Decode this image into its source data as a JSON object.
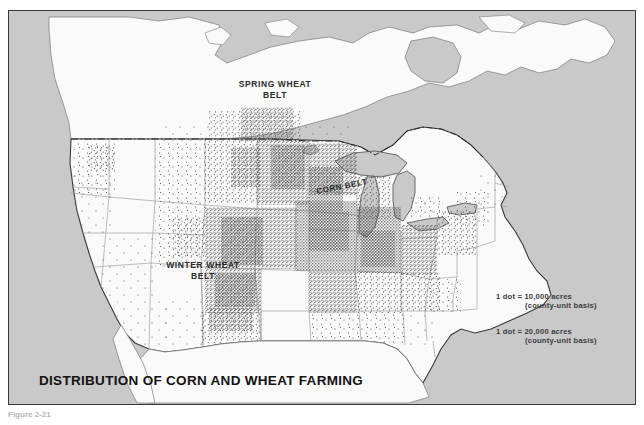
{
  "figure": {
    "caption": "Figure 2-21"
  },
  "map": {
    "title": "DISTRIBUTION OF CORN AND WHEAT FARMING",
    "labels": {
      "spring_wheat": "SPRING WHEAT\nBELT",
      "corn_belt": "CORN BELT",
      "winter_wheat": "WINTER WHEAT\nBELT"
    },
    "legend": [
      {
        "value": "1 dot  =  10,000 acres",
        "basis": "(county-unit basis)"
      },
      {
        "value": "1 dot  =  20,000 acres",
        "basis": "(county-unit basis)"
      }
    ],
    "colors": {
      "ocean": "#c9c9c9",
      "land": "#fafafa",
      "border": "#3a3a3a",
      "dot": "#4a4a4a",
      "state_line": "#8c8c8c",
      "title": "#121212"
    }
  }
}
